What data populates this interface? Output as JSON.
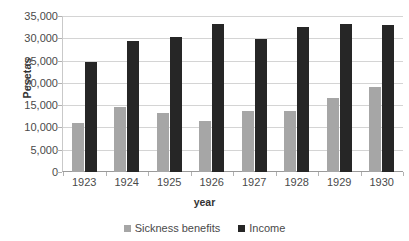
{
  "chart_data": {
    "type": "bar",
    "title": "",
    "subtitle": "",
    "xlabel": "year",
    "ylabel": "Pesetas",
    "categories": [
      "1923",
      "1924",
      "1925",
      "1926",
      "1927",
      "1928",
      "1929",
      "1930"
    ],
    "series": [
      {
        "name": "Sickness benefits",
        "color": "#a6a6a6",
        "values": [
          10900,
          14600,
          13200,
          11500,
          13700,
          13800,
          16600,
          19100
        ]
      },
      {
        "name": "Income",
        "color": "#262626",
        "values": [
          24700,
          29300,
          30200,
          33200,
          29800,
          32500,
          33300,
          32900
        ]
      }
    ],
    "ylim": [
      0,
      35000
    ],
    "ytick_step": 5000,
    "ytick_labels": [
      "35,000",
      "30,000",
      "25,000",
      "20,000",
      "15,000",
      "10,000",
      "5,000",
      "0"
    ],
    "ytick_values": [
      35000,
      30000,
      25000,
      20000,
      15000,
      10000,
      5000,
      0
    ],
    "grid": true,
    "legend_position": "bottom"
  },
  "legend": {
    "items": [
      {
        "label": "Sickness benefits",
        "marker": "square-marker-gray"
      },
      {
        "label": "Income",
        "marker": "square-marker-black"
      }
    ]
  }
}
